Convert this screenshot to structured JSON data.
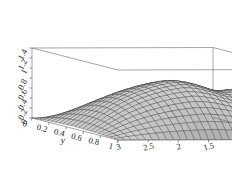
{
  "figure": {
    "kind": "3d-surface-plot",
    "style": "mathematica-plot3d",
    "background_color": "#ffffff",
    "frame_color": "#555555",
    "mesh_color": "#2b2b2b",
    "surface_shading": "grayscale"
  },
  "chart_data": {
    "type": "surface",
    "title": "",
    "xlabel": "x",
    "ylabel": "y",
    "zlabel": "",
    "xlim": [
      0,
      3
    ],
    "ylim": [
      0,
      1
    ],
    "zlim": [
      0,
      1.4
    ],
    "x_axis_reversed": true,
    "grid": false,
    "legend": null,
    "x_ticks": [
      "3",
      "2.5",
      "2",
      "1.5",
      "1",
      "0.5",
      "0"
    ],
    "x_tick_values": [
      3,
      2.5,
      2,
      1.5,
      1,
      0.5,
      0
    ],
    "y_ticks": [
      "0",
      "0.2",
      "0.4",
      "0.6",
      "0.8",
      "1"
    ],
    "y_tick_values": [
      0,
      0.2,
      0.4,
      0.6,
      0.8,
      1
    ],
    "z_ticks": [
      "0",
      "0.2",
      "0.4",
      "0.6",
      "0.8",
      "1",
      "1.2",
      "1.4"
    ],
    "z_tick_values": [
      0,
      0.2,
      0.4,
      0.6,
      0.8,
      1,
      1.2,
      1.4
    ],
    "mesh_nx": 26,
    "mesh_ny": 22
  },
  "axes": {
    "x_label": "x",
    "y_label": "y",
    "z_label": ""
  },
  "labels": {
    "x": [
      "3",
      "2.5",
      "2",
      "1.5",
      "1",
      "0.5",
      "0"
    ],
    "y": [
      "0",
      "0.2",
      "0.4",
      "0.6",
      "0.8",
      "1"
    ],
    "z": [
      "1.4",
      "1.2",
      "1",
      "0.8",
      "0.6",
      "0.4",
      "0.2",
      "0"
    ]
  }
}
